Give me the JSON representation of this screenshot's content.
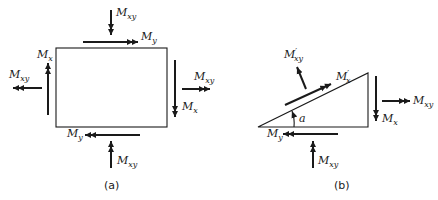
{
  "figure_a": {
    "caption": "(a)",
    "labels": {
      "top_mxy": {
        "base": "M",
        "sub": "xy"
      },
      "top_my": {
        "base": "M",
        "sub": "y"
      },
      "left_mx": {
        "base": "M",
        "sub": "x"
      },
      "left_mxy": {
        "base": "M",
        "sub": "xy"
      },
      "right_mxy": {
        "base": "M",
        "sub": "xy"
      },
      "right_mx": {
        "base": "M",
        "sub": "x"
      },
      "bottom_my": {
        "base": "M",
        "sub": "y"
      },
      "bottom_mxy": {
        "base": "M",
        "sub": "xy"
      }
    }
  },
  "figure_b": {
    "caption": "(b)",
    "angle_label": "a",
    "labels": {
      "hyp_mxy_prime": {
        "base": "M",
        "prime": "′",
        "sub": "xy"
      },
      "hyp_mx_prime": {
        "base": "M",
        "prime": "′",
        "sub": "x"
      },
      "right_mxy": {
        "base": "M",
        "sub": "xy"
      },
      "right_mx": {
        "base": "M",
        "sub": "x"
      },
      "bottom_my": {
        "base": "M",
        "sub": "y"
      },
      "bottom_mxy": {
        "base": "M",
        "sub": "xy"
      }
    }
  },
  "colors": {
    "ink": "#1a1a1a",
    "background": "#ffffff"
  }
}
